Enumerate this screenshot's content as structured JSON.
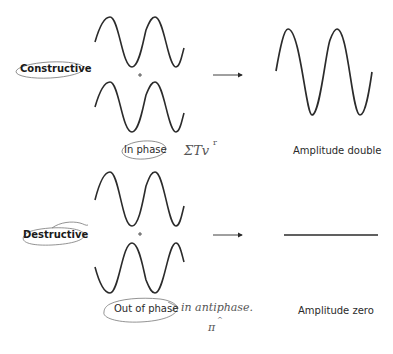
{
  "diagram": {
    "constructive": {
      "label": "Constructive",
      "plus": "+",
      "input_condition": "In phase",
      "result_label": "Amplitude double",
      "annotation": "2πʳ",
      "annotation_text": "ΣTvʳ"
    },
    "destructive": {
      "label": "Destructive",
      "plus": "+",
      "input_condition": "Out of phase",
      "result_label": "Amplitude zero",
      "annotation_line1": "in antiphase.",
      "annotation_line2": "πʳ"
    }
  },
  "colors": {
    "stroke": "#2b2b2b",
    "pencil": "#666666",
    "background": "#ffffff"
  }
}
